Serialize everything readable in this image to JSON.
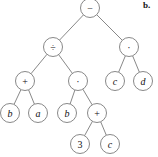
{
  "diagram": {
    "type": "expression-tree",
    "panel_label": "b.",
    "nodes": [
      {
        "id": "n0",
        "label": "−",
        "kind": "op",
        "x": 90,
        "y": 8
      },
      {
        "id": "n1",
        "label": "÷",
        "kind": "op",
        "x": 53,
        "y": 47
      },
      {
        "id": "n2",
        "label": "·",
        "kind": "op",
        "x": 129,
        "y": 47
      },
      {
        "id": "n3",
        "label": "+",
        "kind": "op",
        "x": 25,
        "y": 81
      },
      {
        "id": "n4",
        "label": "·",
        "kind": "op",
        "x": 78,
        "y": 81
      },
      {
        "id": "n5",
        "label": "c",
        "kind": "var",
        "x": 115,
        "y": 81
      },
      {
        "id": "n6",
        "label": "d",
        "kind": "var",
        "x": 143,
        "y": 81
      },
      {
        "id": "n7",
        "label": "b",
        "kind": "var",
        "x": 10,
        "y": 113
      },
      {
        "id": "n8",
        "label": "a",
        "kind": "var",
        "x": 38,
        "y": 113
      },
      {
        "id": "n9",
        "label": "b",
        "kind": "var",
        "x": 67,
        "y": 113
      },
      {
        "id": "n10",
        "label": "+",
        "kind": "op",
        "x": 97,
        "y": 113
      },
      {
        "id": "n11",
        "label": "3",
        "kind": "num",
        "x": 80,
        "y": 144
      },
      {
        "id": "n12",
        "label": "c",
        "kind": "var",
        "x": 110,
        "y": 144
      }
    ],
    "edges": [
      [
        "n0",
        "n1"
      ],
      [
        "n0",
        "n2"
      ],
      [
        "n1",
        "n3"
      ],
      [
        "n1",
        "n4"
      ],
      [
        "n2",
        "n5"
      ],
      [
        "n2",
        "n6"
      ],
      [
        "n3",
        "n7"
      ],
      [
        "n3",
        "n8"
      ],
      [
        "n4",
        "n9"
      ],
      [
        "n4",
        "n10"
      ],
      [
        "n10",
        "n11"
      ],
      [
        "n10",
        "n12"
      ]
    ],
    "node_radius": 9.5
  }
}
